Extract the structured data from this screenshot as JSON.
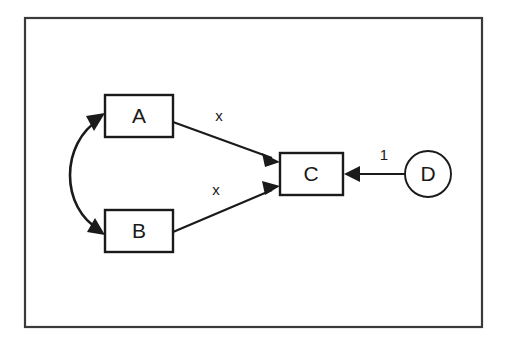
{
  "figure": {
    "background_color": "#ffffff",
    "stroke_color": "#1a1a1a",
    "frame_color": "#3a3a3a",
    "frame": {
      "x": 25,
      "y": 18,
      "width": 457,
      "height": 309
    }
  },
  "nodes": [
    {
      "id": "A",
      "label": "A",
      "shape": "rectangle",
      "x": 105,
      "y": 95,
      "width": 68,
      "height": 42,
      "center_x": 139,
      "center_y": 116
    },
    {
      "id": "B",
      "label": "B",
      "shape": "rectangle",
      "x": 105,
      "y": 210,
      "width": 68,
      "height": 42,
      "center_x": 139,
      "center_y": 231
    },
    {
      "id": "C",
      "label": "C",
      "shape": "rectangle",
      "x": 280,
      "y": 153,
      "width": 63,
      "height": 42,
      "center_x": 311,
      "center_y": 174
    },
    {
      "id": "D",
      "label": "D",
      "shape": "circle",
      "center_x": 428,
      "center_y": 174,
      "radius": 23
    }
  ],
  "edges": [
    {
      "id": "a-to-c",
      "from": "A",
      "to": "C",
      "label": "x",
      "label_x": 219,
      "label_y": 117,
      "x1": 173,
      "y1": 122,
      "x2": 279,
      "y2": 161,
      "arrow": "end"
    },
    {
      "id": "b-to-c",
      "from": "B",
      "to": "C",
      "label": "x",
      "label_x": 216,
      "label_y": 191,
      "x1": 173,
      "y1": 232,
      "x2": 279,
      "y2": 187,
      "arrow": "end"
    },
    {
      "id": "d-to-c",
      "from": "D",
      "to": "C",
      "label": "1",
      "label_x": 384,
      "label_y": 156,
      "x1": 405,
      "y1": 174,
      "x2": 344,
      "y2": 174,
      "arrow": "end"
    },
    {
      "id": "a-b-bidirectional",
      "from": "A",
      "to": "B",
      "label": "",
      "arrow": "both",
      "curve": "left-arc"
    }
  ]
}
